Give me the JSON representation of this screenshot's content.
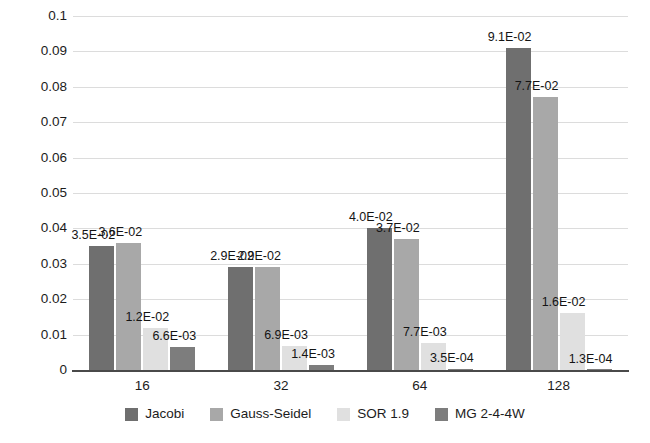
{
  "chart_data": {
    "type": "bar",
    "title": "",
    "subtitle": "",
    "xlabel": "",
    "ylabel": "",
    "categories": [
      "16",
      "32",
      "64",
      "128"
    ],
    "ylim": [
      0,
      0.1
    ],
    "yticks": [
      "0",
      "0.01",
      "0.02",
      "0.03",
      "0.04",
      "0.05",
      "0.06",
      "0.07",
      "0.08",
      "0.09",
      "0.1"
    ],
    "ytick_values": [
      0,
      0.01,
      0.02,
      0.03,
      0.04,
      0.05,
      0.06,
      0.07,
      0.08,
      0.09,
      0.1
    ],
    "grid": true,
    "legend_position": "bottom",
    "series": [
      {
        "name": "Jacobi",
        "color": "#6f6f6f",
        "values": [
          0.035,
          0.029,
          0.04,
          0.091
        ],
        "labels": [
          "3.5E-02",
          "2.9E-02",
          "4.0E-02",
          "9.1E-02"
        ]
      },
      {
        "name": "Gauss-Seidel",
        "color": "#a8a8a8",
        "values": [
          0.036,
          0.029,
          0.037,
          0.077
        ],
        "labels": [
          "3.6E-02",
          "2.9E-02",
          "3.7E-02",
          "7.7E-02"
        ]
      },
      {
        "name": "SOR 1.9",
        "color": "#e0e0e0",
        "values": [
          0.012,
          0.0069,
          0.0077,
          0.016
        ],
        "labels": [
          "1.2E-02",
          "6.9E-03",
          "7.7E-03",
          "1.6E-02"
        ]
      },
      {
        "name": "MG 2-4-4W",
        "color": "#7d7d7d",
        "values": [
          0.0066,
          0.0014,
          0.00035,
          0.00013
        ],
        "labels": [
          "6.6E-03",
          "1.4E-03",
          "3.5E-04",
          "1.3E-04"
        ]
      }
    ]
  },
  "colors": {
    "gridline": "#dcdcdc",
    "axis": "#4a4a4a",
    "text": "#1c1c1c",
    "background": "#ffffff"
  }
}
